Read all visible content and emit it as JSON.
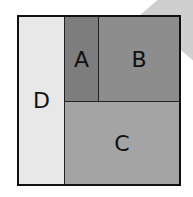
{
  "diagram": {
    "regions": [
      {
        "id": "A",
        "label": "A",
        "color": "#7d7d7d"
      },
      {
        "id": "B",
        "label": "B",
        "color": "#8d8d8d"
      },
      {
        "id": "C",
        "label": "C",
        "color": "#a4a4a4"
      },
      {
        "id": "D",
        "label": "D",
        "color": "#e8e8e8"
      }
    ],
    "border_color": "#111111"
  }
}
